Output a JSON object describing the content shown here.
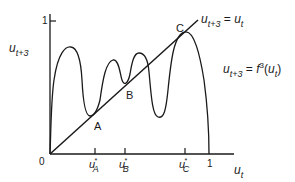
{
  "diagram": {
    "type": "cobweb-map",
    "y_axis": {
      "var": "u",
      "sub": "t+3",
      "tick_label": "1"
    },
    "x_axis": {
      "var": "u",
      "sub": "t",
      "tick_label": "1",
      "origin_label": "0"
    },
    "diagonal_label": {
      "lhs_var": "u",
      "lhs_sub": "t+3",
      "eq": " = ",
      "rhs_var": "u",
      "rhs_sub": "t"
    },
    "curve_label": {
      "lhs_var": "u",
      "lhs_sub": "t+3",
      "eq": " = ",
      "func": "f",
      "sup": "3",
      "arg_open": "(",
      "arg_var": "u",
      "arg_sub": "t",
      "arg_close": ")"
    },
    "fixed_points": [
      {
        "label": "A",
        "tick_var": "u",
        "tick_sub": "A"
      },
      {
        "label": "B",
        "tick_var": "u",
        "tick_sub": "B"
      },
      {
        "label": "C",
        "tick_var": "u",
        "tick_sub": "C"
      }
    ],
    "star": "*",
    "colors": {
      "line": "#1a1a1a",
      "background": "#ffffff"
    }
  }
}
